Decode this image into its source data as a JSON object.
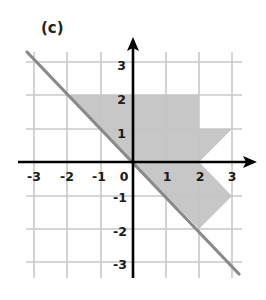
{
  "panel_label": "(c)",
  "axes": {
    "x_ticks": [
      "-3",
      "-2",
      "-1",
      "0",
      "1",
      "2",
      "3"
    ],
    "y_ticks_positive": [
      "3",
      "2",
      "1"
    ],
    "y_ticks_negative": [
      "-1",
      "-2",
      "-3"
    ],
    "x_range": [
      -3,
      3
    ],
    "y_range": [
      -3,
      3
    ],
    "grid": true
  },
  "shape": {
    "description": "Shaded polygon bounded by line y = -x",
    "vertices": [
      [
        -2,
        2
      ],
      [
        2,
        2
      ],
      [
        2,
        1
      ],
      [
        3,
        1
      ],
      [
        2,
        0
      ],
      [
        3,
        -1
      ],
      [
        2,
        -2
      ]
    ],
    "fill_color": "#c4c4c4"
  },
  "line": {
    "equation": "y = -x",
    "from": [
      -3.2,
      3.3
    ],
    "to": [
      3.2,
      -3.4
    ],
    "color": "#8a8a8a"
  },
  "colors": {
    "grid": "#c8c8c8",
    "axis": "#000000",
    "shape": "#c4c4c4",
    "mirror_line": "#8a8a8a"
  }
}
